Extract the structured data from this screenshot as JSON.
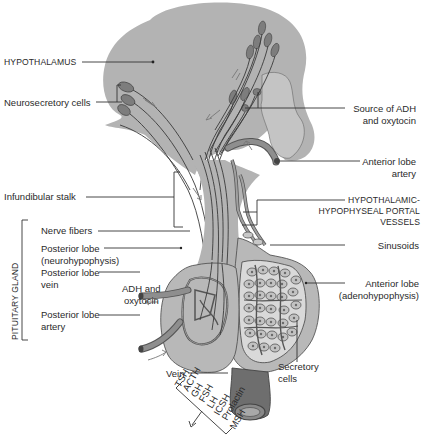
{
  "figure": {
    "colors": {
      "tissue": "#b3b3b3",
      "tissue_light": "#c8c8c8",
      "outline": "#555555",
      "vessel": "#8e8e8e",
      "text": "#2a2a2a",
      "background": "#ffffff"
    }
  },
  "labels": {
    "hypothalamus": "HYPOTHALAMUS",
    "neurosecretory_cells": "Neurosecretory cells",
    "source_adh_line1": "Source of ADH",
    "source_adh_line2": "and oxytocin",
    "anterior_lobe_artery_line1": "Anterior lobe",
    "anterior_lobe_artery_line2": "artery",
    "infundibular_stalk": "Infundibular stalk",
    "portal_vessels_line1": "HYPOTHALAMIC-",
    "portal_vessels_line2": "HYPOPHYSEAL PORTAL",
    "portal_vessels_line3": "VESSELS",
    "pituitary_gland": "PITUITARY GLAND",
    "nerve_fibers": "Nerve fibers",
    "posterior_lobe_line1": "Posterior lobe",
    "posterior_lobe_line2": "(neurohypophysis)",
    "posterior_lobe_vein_line1": "Posterior lobe",
    "posterior_lobe_vein_line2": "vein",
    "adh_oxytocin_line1": "ADH and",
    "adh_oxytocin_line2": "oxytocin",
    "posterior_lobe_artery_line1": "Posterior lobe",
    "posterior_lobe_artery_line2": "artery",
    "sinusoids": "Sinusoids",
    "anterior_lobe_line1": "Anterior lobe",
    "anterior_lobe_line2": "(adenohypophysis)",
    "vein": "Vein",
    "secretory_cells_line1": "Secretory",
    "secretory_cells_line2": "cells"
  },
  "hormones": [
    "TSH",
    "ACTH",
    "GH",
    "FSH",
    "LH",
    "ICSH",
    "Prolactin",
    "MSH"
  ]
}
